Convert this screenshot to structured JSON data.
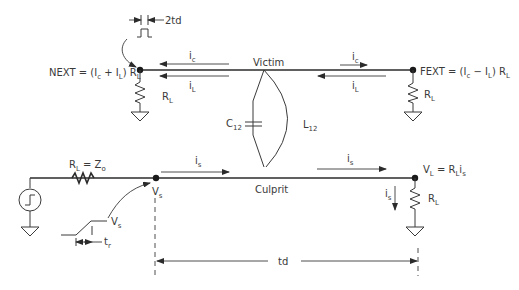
{
  "lines": {
    "victim_label": "Victim",
    "culprit_label": "Culprit"
  },
  "coupling": {
    "capacitance_main": "C",
    "capacitance_sub": "12",
    "inductance_main": "L",
    "inductance_sub": "12"
  },
  "next": {
    "prefix": "NEXT = (I",
    "sub1": "c",
    "op": " + I",
    "sub2": "L",
    "suffix": ") R",
    "sub3": "L"
  },
  "fext": {
    "prefix": "FEXT = (I",
    "sub1": "c",
    "op": " − I",
    "sub2": "L",
    "suffix": ") R",
    "sub3": "L"
  },
  "victim_currents": {
    "near_ic_main": "i",
    "near_ic_sub": "c",
    "near_il_main": "i",
    "near_il_sub": "L",
    "far_ic_main": "i",
    "far_ic_sub": "c",
    "far_il_main": "i",
    "far_il_sub": "L"
  },
  "resistors": {
    "near_main": "R",
    "near_sub": "L",
    "far_main": "R",
    "far_sub": "L",
    "load_main": "R",
    "load_sub": "L",
    "source_main": "R",
    "source_sub": "L",
    "source_eq": " = Z",
    "source_eq_sub": "o"
  },
  "culprit_currents": {
    "is1_main": "i",
    "is1_sub": "s",
    "is2_main": "i",
    "is2_sub": "s",
    "is3_main": "i",
    "is3_sub": "s"
  },
  "nodes": {
    "vs_main": "V",
    "vs_sub": "s",
    "vs_wave_main": "V",
    "vs_wave_sub": "s",
    "vl_main": "V",
    "vl_sub": "L",
    "vl_eq": " = R",
    "vl_eq_sub": "L",
    "vl_i": "i",
    "vl_i_sub": "s"
  },
  "timing": {
    "pulse_width": "2td",
    "rise_main": "t",
    "rise_sub": "r",
    "delay": "td"
  }
}
